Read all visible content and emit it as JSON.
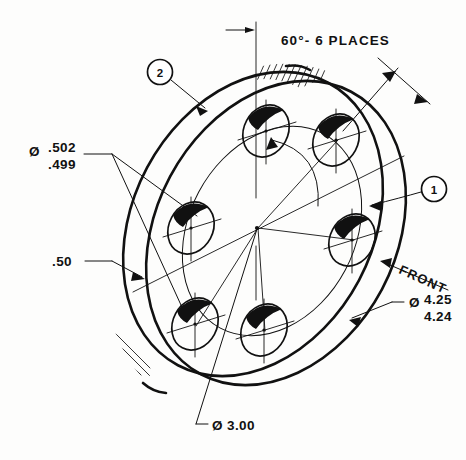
{
  "drawing": {
    "title": "Isometric Disc / Flange Detail",
    "view_label": "FRONT",
    "background_color": "#fdfdfc",
    "line_color": "#111111"
  },
  "notes": {
    "angle_note": "60°- 6 PLACES"
  },
  "dimensions": {
    "hole_diameter": {
      "symbol": "Ø",
      "upper": ".502",
      "lower": ".499",
      "name": "hole-diameter-dimension"
    },
    "outer_diameter": {
      "symbol": "Ø",
      "upper": "4.25",
      "lower": "4.24",
      "name": "outer-diameter-dimension"
    },
    "bolt_circle": {
      "symbol": "Ø",
      "value": "3.00",
      "text": "Ø 3.00",
      "name": "bolt-circle-dimension"
    },
    "thickness": {
      "value": ".50",
      "name": "thickness-dimension"
    }
  },
  "balloons": [
    {
      "id": "balloon-1",
      "label": "1"
    },
    {
      "id": "balloon-2",
      "label": "2"
    }
  ],
  "geometry": {
    "hole_count": 6,
    "hole_spacing_degrees": 60
  }
}
